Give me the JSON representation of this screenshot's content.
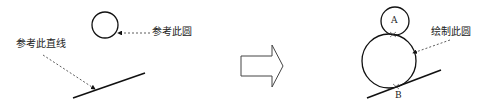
{
  "left_panel": {
    "circle_label": "参考此圆",
    "line_label": "参考此直线"
  },
  "right_panel": {
    "circle_label": "绘制此圆",
    "point_a": "A",
    "point_b": "B"
  },
  "colors": {
    "stroke": "#111111",
    "dashed": "#333333"
  }
}
